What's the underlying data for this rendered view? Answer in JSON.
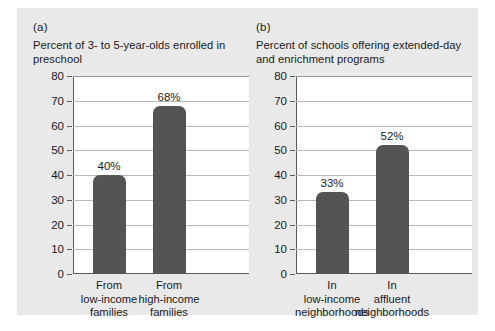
{
  "figure": {
    "background_color": "#e9e9e9",
    "bar_color": "#545454",
    "axis_color": "#5a5a5a",
    "grid_color": "#b9b9b9"
  },
  "panels": [
    {
      "letter": "(a)",
      "caption": "Percent of 3- to 5-year-olds enrolled in preschool"
    },
    {
      "letter": "(b)",
      "caption": "Percent of schools offering extended-day and enrichment programs"
    }
  ],
  "chart_data": [
    {
      "type": "bar",
      "title": "Percent of 3- to 5-year-olds enrolled in preschool",
      "panel": "(a)",
      "categories": [
        "From low-income families",
        "From high-income families"
      ],
      "category_lines": [
        [
          "From",
          "low-income",
          "families"
        ],
        [
          "From",
          "high-income",
          "families"
        ]
      ],
      "values": [
        40,
        68
      ],
      "data_labels": [
        "40%",
        "68%"
      ],
      "xlabel": "",
      "ylabel": "",
      "ylim": [
        0,
        80
      ],
      "yticks": [
        0,
        10,
        20,
        30,
        40,
        50,
        60,
        70,
        80
      ],
      "ytick_labels": [
        "0",
        "10",
        "20",
        "30",
        "40",
        "50",
        "60",
        "70",
        "80"
      ],
      "grid": true,
      "legend": "none"
    },
    {
      "type": "bar",
      "title": "Percent of schools offering extended-day and enrichment programs",
      "panel": "(b)",
      "categories": [
        "In low-income neighborhoods",
        "In affluent neighborhoods"
      ],
      "category_lines": [
        [
          "In",
          "low-income",
          "neighborhoods"
        ],
        [
          "In",
          "affluent",
          "neighborhoods"
        ]
      ],
      "values": [
        33,
        52
      ],
      "data_labels": [
        "33%",
        "52%"
      ],
      "xlabel": "",
      "ylabel": "",
      "ylim": [
        0,
        80
      ],
      "yticks": [
        0,
        10,
        20,
        30,
        40,
        50,
        60,
        70,
        80
      ],
      "ytick_labels": [
        "0",
        "10",
        "20",
        "30",
        "40",
        "50",
        "60",
        "70",
        "80"
      ],
      "grid": true,
      "legend": "none"
    }
  ]
}
